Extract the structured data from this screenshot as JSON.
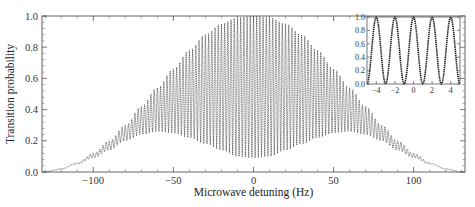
{
  "chart_data": [
    {
      "type": "line",
      "title": "",
      "xlabel": "Microwave detuning (Hz)",
      "ylabel": "Transition probability",
      "xlim": [
        -132,
        132
      ],
      "ylim": [
        0.0,
        1.0
      ],
      "xticks": [
        -100,
        -50,
        0,
        50,
        100
      ],
      "xtick_labels": [
        "−100",
        "−50",
        "0",
        "50",
        "100"
      ],
      "yticks": [
        0.0,
        0.2,
        0.4,
        0.6,
        0.8,
        1.0
      ],
      "ytick_labels": [
        "0.0",
        "0.2",
        "0.4",
        "0.6",
        "0.8",
        "1.0"
      ],
      "grid": false,
      "legend": null,
      "description": "Dense Ramsey fringes (period ~2 Hz) under a broad envelope; upper envelope peaks at 1.0 near 0 Hz, lower envelope peaks ~0.26 near ±60 Hz and dips to ~0.09 at 0 Hz.",
      "fringe_period_hz": 2.0,
      "series": [
        {
          "name": "upper envelope",
          "x": [
            -130,
            -120,
            -110,
            -100,
            -90,
            -80,
            -70,
            -60,
            -50,
            -40,
            -30,
            -20,
            -10,
            0,
            10,
            20,
            30,
            40,
            50,
            60,
            70,
            80,
            90,
            100,
            110,
            120,
            130
          ],
          "values": [
            0.0,
            0.02,
            0.06,
            0.12,
            0.2,
            0.3,
            0.42,
            0.54,
            0.66,
            0.78,
            0.88,
            0.95,
            0.99,
            1.0,
            0.99,
            0.95,
            0.88,
            0.78,
            0.66,
            0.54,
            0.42,
            0.3,
            0.2,
            0.12,
            0.06,
            0.02,
            0.0
          ]
        },
        {
          "name": "lower envelope",
          "x": [
            -130,
            -120,
            -110,
            -100,
            -90,
            -80,
            -70,
            -60,
            -50,
            -40,
            -30,
            -20,
            -10,
            0,
            10,
            20,
            30,
            40,
            50,
            60,
            70,
            80,
            90,
            100,
            110,
            120,
            130
          ],
          "values": [
            0.0,
            0.02,
            0.05,
            0.09,
            0.14,
            0.2,
            0.24,
            0.26,
            0.25,
            0.22,
            0.18,
            0.14,
            0.1,
            0.09,
            0.1,
            0.14,
            0.18,
            0.22,
            0.25,
            0.26,
            0.24,
            0.2,
            0.14,
            0.09,
            0.05,
            0.02,
            0.0
          ]
        }
      ]
    },
    {
      "type": "line",
      "title": "inset",
      "xlabel": "",
      "ylabel": "",
      "xlim": [
        -5,
        5
      ],
      "ylim": [
        0.0,
        1.0
      ],
      "xticks": [
        -4,
        -2,
        0,
        2,
        4
      ],
      "xtick_labels": [
        "−4",
        "−2",
        "0",
        "2",
        "4"
      ],
      "yticks": [
        0.0,
        0.2,
        0.4,
        0.6,
        0.8,
        1.0
      ],
      "ytick_labels": [
        "0.0",
        "0.2",
        "0.4",
        "0.6",
        "0.8",
        "1.0"
      ],
      "grid": false,
      "series": [
        {
          "name": "central fringes",
          "x": [
            -5,
            -4,
            -3,
            -2,
            -1,
            0,
            1,
            2,
            3,
            4,
            5
          ],
          "values": [
            0.0,
            1.0,
            0.0,
            1.0,
            0.0,
            1.0,
            0.0,
            1.0,
            0.0,
            1.0,
            0.0
          ]
        }
      ]
    }
  ]
}
